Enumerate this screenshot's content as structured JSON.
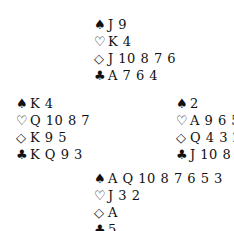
{
  "diagram": {
    "type": "bridge-deal",
    "hands": {
      "north": {
        "spades": "J 9",
        "hearts": "K 4",
        "diamonds": "J 10 8 7 6",
        "clubs": "A 7 6 4"
      },
      "west": {
        "spades": "K 4",
        "hearts": "Q 10 8 7",
        "diamonds": "K 9 5",
        "clubs": "K Q 9 3"
      },
      "east": {
        "spades": "2",
        "hearts": "A 9 6 5",
        "diamonds": "Q 4 3 2",
        "clubs": "J 10 8 2"
      },
      "south": {
        "spades": "A Q 10 8 7 6 5 3",
        "hearts": "J 3 2",
        "diamonds": "A",
        "clubs": "5"
      }
    },
    "suit_symbols": {
      "spades": "♠",
      "hearts": "♡",
      "diamonds": "◇",
      "clubs": "♣"
    }
  }
}
